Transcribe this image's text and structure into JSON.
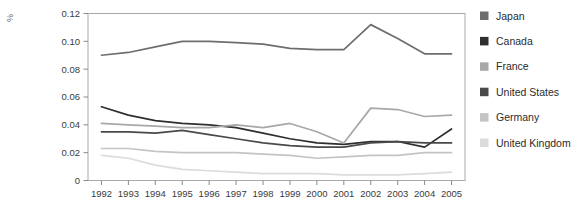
{
  "chart_data": {
    "type": "line",
    "title": "",
    "xlabel": "",
    "ylabel": "%",
    "ylim": [
      0,
      0.12
    ],
    "xlim": [
      1992,
      2005
    ],
    "grid": false,
    "legend_position": "right",
    "ytick_labels": [
      "0.12",
      "0.10",
      "0.08",
      "0.06",
      "0.04",
      "0.02",
      "0"
    ],
    "ytick_values": [
      0.12,
      0.1,
      0.08,
      0.06,
      0.04,
      0.02,
      0
    ],
    "categories": [
      "1992",
      "1993",
      "1994",
      "1995",
      "1996",
      "1997",
      "1998",
      "1999",
      "2000",
      "2001",
      "2002",
      "2003",
      "2004",
      "2005"
    ],
    "series": [
      {
        "name": "Japan",
        "color": "#6e6e6e",
        "values": [
          0.09,
          0.092,
          0.096,
          0.1,
          0.1,
          0.099,
          0.098,
          0.095,
          0.094,
          0.094,
          0.112,
          0.102,
          0.091,
          0.091
        ]
      },
      {
        "name": "Canada",
        "color": "#2f2f2f",
        "values": [
          0.053,
          0.047,
          0.043,
          0.041,
          0.04,
          0.038,
          0.034,
          0.03,
          0.027,
          0.026,
          0.028,
          0.028,
          0.024,
          0.037
        ]
      },
      {
        "name": "France",
        "color": "#a8a8a8",
        "values": [
          0.041,
          0.04,
          0.039,
          0.038,
          0.038,
          0.04,
          0.038,
          0.041,
          0.035,
          0.027,
          0.052,
          0.051,
          0.046,
          0.047
        ]
      },
      {
        "name": "United States",
        "color": "#4a4a4a",
        "values": [
          0.035,
          0.035,
          0.034,
          0.036,
          0.033,
          0.03,
          0.027,
          0.025,
          0.024,
          0.024,
          0.027,
          0.028,
          0.027,
          0.027
        ]
      },
      {
        "name": "Germany",
        "color": "#c4c4c4",
        "values": [
          0.023,
          0.023,
          0.021,
          0.02,
          0.02,
          0.02,
          0.019,
          0.018,
          0.016,
          0.017,
          0.018,
          0.018,
          0.02,
          0.02
        ]
      },
      {
        "name": "United Kingdom",
        "color": "#dcdcdc",
        "values": [
          0.018,
          0.016,
          0.011,
          0.008,
          0.007,
          0.006,
          0.005,
          0.005,
          0.005,
          0.004,
          0.004,
          0.004,
          0.005,
          0.006
        ]
      }
    ]
  }
}
